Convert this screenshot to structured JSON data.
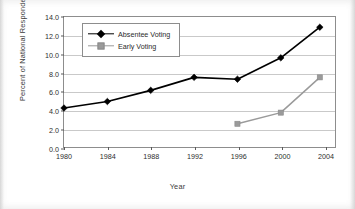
{
  "chart_data": {
    "type": "line",
    "title": "",
    "xlabel": "Year",
    "ylabel": "Percent of National Respondents",
    "x": [
      1980,
      1984,
      1988,
      1992,
      1996,
      2000,
      2004
    ],
    "categories": [
      "1980",
      "1984",
      "1988",
      "1992",
      "1996",
      "2000",
      "2004"
    ],
    "xlim": [
      1980,
      2005
    ],
    "ylim": [
      0.0,
      14.0
    ],
    "yticks": [
      0.0,
      2.0,
      4.0,
      6.0,
      8.0,
      10.0,
      12.0,
      14.0
    ],
    "ytick_labels": [
      "0.0",
      "2.0",
      "4.0",
      "6.0",
      "8.0",
      "10.0",
      "12.0",
      "14.0"
    ],
    "xticks": [
      1980,
      1984,
      1988,
      1992,
      1996,
      2000,
      2004
    ],
    "xtick_labels": [
      "1980",
      "1984",
      "1988",
      "1992",
      "1996",
      "2000",
      "2004"
    ],
    "grid": "horizontal",
    "legend_position": "top-left-inside",
    "series": [
      {
        "name": "Absentee Voting",
        "color": "#000000",
        "marker": "diamond",
        "x": [
          1980,
          1984,
          1988,
          1992,
          1996,
          2000,
          2003.6
        ],
        "values": [
          4.2,
          4.9,
          6.1,
          7.5,
          7.3,
          9.6,
          12.9
        ]
      },
      {
        "name": "Early Voting",
        "color": "#9a9a9a",
        "marker": "square",
        "x": [
          1996,
          2000,
          2003.6
        ],
        "values": [
          2.5,
          3.7,
          7.5
        ]
      }
    ]
  },
  "legend": {
    "items": [
      {
        "label": "Absentee Voting"
      },
      {
        "label": "Early Voting"
      }
    ]
  },
  "axes": {
    "x_title": "Year",
    "y_title": "Percent of National Respondents"
  },
  "colors": {
    "absentee": "#000000",
    "early": "#9a9a9a",
    "grid": "#c9c9c9",
    "frame": "#8d8d8d",
    "text": "#2e2e2e"
  }
}
